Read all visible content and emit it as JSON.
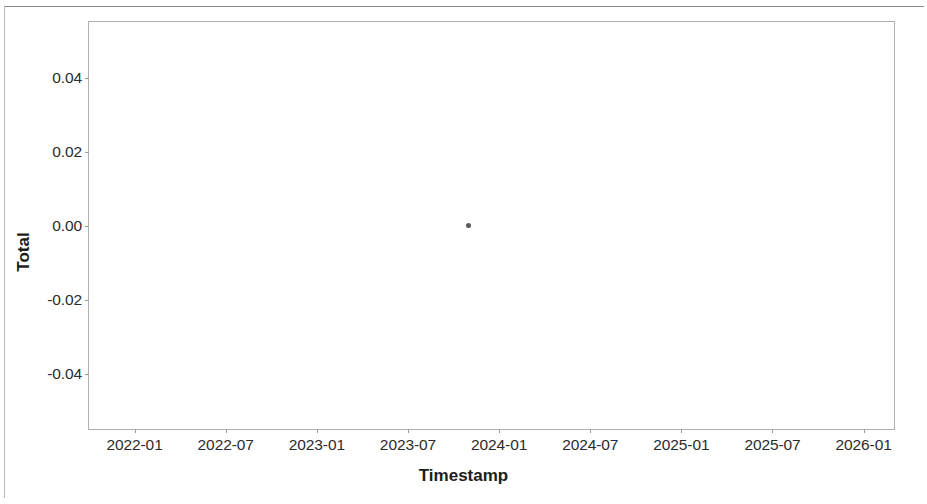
{
  "chart_data": {
    "type": "scatter",
    "title": "",
    "subtitle": "",
    "xlabel": "Timestamp",
    "ylabel": "Total",
    "grid": false,
    "legend": null,
    "legend_position": "none",
    "x_tick_labels": [
      "2022-01",
      "2022-07",
      "2023-01",
      "2023-07",
      "2024-01",
      "2024-07",
      "2025-01",
      "2025-07",
      "2026-01"
    ],
    "y_tick_labels": [
      "0.04",
      "0.02",
      "0.00",
      "-0.02",
      "-0.04"
    ],
    "y_tick_values": [
      0.04,
      0.02,
      0.0,
      -0.02,
      -0.04
    ],
    "ylim": [
      -0.055,
      0.055
    ],
    "xlim": [
      "2021-10",
      "2026-03"
    ],
    "series": [
      {
        "name": "Total",
        "marker": "circle",
        "color": "#5a5a5a",
        "points": [
          {
            "x": "2023-11",
            "y": 0.0
          }
        ]
      }
    ],
    "annotations": []
  },
  "figure": {
    "background_color": "#ffffff",
    "frame_color": "#b0b0b0",
    "tick_color": "#9a9a9a",
    "text_color": "#2b2b2b"
  }
}
